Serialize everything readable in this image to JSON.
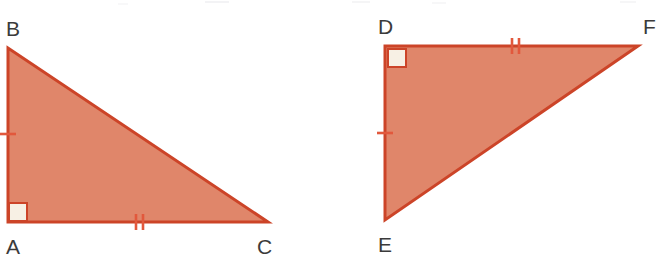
{
  "figure": {
    "background_color": "#ffffff",
    "width": 661,
    "height": 264,
    "style": {
      "fill_color": "#E0866A",
      "stroke_color": "#CC4428",
      "stroke_width": 3,
      "label_color": "#3b3b3b",
      "right_angle_fill": "#F7F0E4",
      "right_angle_stroke": "#CC4428",
      "tick_color": "#E2583C",
      "tick_width": 2.6
    }
  },
  "triangles": [
    {
      "name": "triangle-abc",
      "vertices": [
        {
          "label": "A",
          "x": 8,
          "y": 222,
          "label_x": 6,
          "label_y": 254,
          "right_angle": true
        },
        {
          "label": "B",
          "x": 8,
          "y": 48,
          "label_x": 6,
          "label_y": 36,
          "right_angle": false
        },
        {
          "label": "C",
          "x": 268,
          "y": 222,
          "label_x": 257,
          "label_y": 254,
          "right_angle": false
        }
      ],
      "points": "8,48 8,222 268,222",
      "right_angle_at": "A",
      "right_angle_box": {
        "x": 9,
        "y": 203,
        "size": 18
      },
      "sides": [
        {
          "name": "AB",
          "from": "A",
          "to": "B",
          "ticks": 1,
          "tick_orientation": "horizontal",
          "tick_center_x": 8,
          "tick_center_y": 134,
          "tick_length": 16
        },
        {
          "name": "AC",
          "from": "A",
          "to": "C",
          "ticks": 2,
          "tick_orientation": "vertical",
          "tick_center_x": 139,
          "tick_center_y": 222,
          "tick_length": 16,
          "tick_gap": 6
        },
        {
          "name": "BC",
          "from": "B",
          "to": "C",
          "ticks": 0
        }
      ]
    },
    {
      "name": "triangle-def",
      "vertices": [
        {
          "label": "D",
          "x": 385,
          "y": 46,
          "label_x": 378,
          "label_y": 34,
          "right_angle": true
        },
        {
          "label": "E",
          "x": 385,
          "y": 220,
          "label_x": 378,
          "label_y": 252,
          "right_angle": false
        },
        {
          "label": "F",
          "x": 638,
          "y": 46,
          "label_x": 643,
          "label_y": 34,
          "right_angle": false
        }
      ],
      "points": "385,46 638,46 385,220",
      "right_angle_at": "D",
      "right_angle_box": {
        "x": 388,
        "y": 49,
        "size": 18
      },
      "sides": [
        {
          "name": "DE",
          "from": "D",
          "to": "E",
          "ticks": 1,
          "tick_orientation": "horizontal",
          "tick_center_x": 385,
          "tick_center_y": 133,
          "tick_length": 16
        },
        {
          "name": "DF",
          "from": "D",
          "to": "F",
          "ticks": 2,
          "tick_orientation": "vertical",
          "tick_center_x": 515,
          "tick_center_y": 46,
          "tick_length": 16,
          "tick_gap": 6
        },
        {
          "name": "EF",
          "from": "E",
          "to": "F",
          "ticks": 0
        }
      ]
    }
  ],
  "labels": {
    "a": "A",
    "b": "B",
    "c": "C",
    "d": "D",
    "e": "E",
    "f": "F"
  }
}
